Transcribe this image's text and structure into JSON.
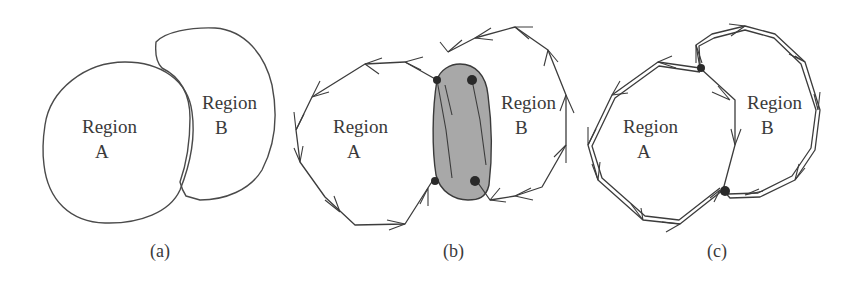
{
  "figure": {
    "panels": [
      {
        "id": "a",
        "caption": "(a)",
        "region_a": {
          "line1": "Region",
          "line2": "A"
        },
        "region_b": {
          "line1": "Region",
          "line2": "B"
        },
        "description": "Two adjacent smooth regions A and B sharing a boundary"
      },
      {
        "id": "b",
        "caption": "(b)",
        "region_a": {
          "line1": "Region",
          "line2": "A"
        },
        "region_b": {
          "line1": "Region",
          "line2": "B"
        },
        "description": "Polygonal approximations with directed edges; shaded gap/overlap area between regions with four junction vertices"
      },
      {
        "id": "c",
        "caption": "(c)",
        "region_a": {
          "line1": "Region",
          "line2": "A"
        },
        "region_b": {
          "line1": "Region",
          "line2": "B"
        },
        "description": "Polygonal approximations sharing a common boundary with two junction vertices; double directed edges"
      }
    ],
    "colors": {
      "background": "#ffffff",
      "line": "#3c3c3c",
      "shade": "#a8a8a8",
      "vertex": "#2a2a2a"
    }
  }
}
